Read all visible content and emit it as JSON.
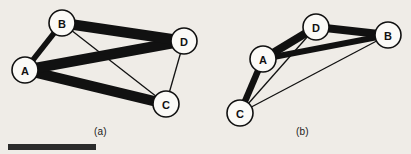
{
  "figure": {
    "background_color": "#efece7",
    "width": 411,
    "height": 154,
    "ink_color": "#111111",
    "node_fill_color": "#fbfaf7",
    "scale_bar": {
      "name": "scale-bar",
      "color": "#2b2b2b",
      "x": 8,
      "y": 144,
      "width": 88,
      "height": 6
    }
  },
  "panels": [
    {
      "id": "a",
      "caption": "(a)",
      "nodes": [
        {
          "label": "A",
          "x": 25,
          "y": 70,
          "r": 13
        },
        {
          "label": "B",
          "x": 62,
          "y": 23,
          "r": 13
        },
        {
          "label": "C",
          "x": 166,
          "y": 104,
          "r": 13
        },
        {
          "label": "D",
          "x": 184,
          "y": 41,
          "r": 13
        }
      ],
      "edges": [
        {
          "from": "A",
          "to": "B",
          "width": 5.5,
          "weight": "medium"
        },
        {
          "from": "A",
          "to": "C",
          "width": 10.5,
          "weight": "thick"
        },
        {
          "from": "A",
          "to": "D",
          "width": 10.5,
          "weight": "thick"
        },
        {
          "from": "B",
          "to": "D",
          "width": 10.5,
          "weight": "thick"
        },
        {
          "from": "B",
          "to": "C",
          "width": 1.3,
          "weight": "thin"
        },
        {
          "from": "C",
          "to": "D",
          "width": 1.3,
          "weight": "thin"
        }
      ]
    },
    {
      "id": "b",
      "caption": "(b)",
      "nodes": [
        {
          "label": "A",
          "x": 263,
          "y": 59,
          "r": 13
        },
        {
          "label": "B",
          "x": 388,
          "y": 35,
          "r": 13
        },
        {
          "label": "C",
          "x": 240,
          "y": 113,
          "r": 13
        },
        {
          "label": "D",
          "x": 316,
          "y": 27,
          "r": 13
        }
      ],
      "edges": [
        {
          "from": "A",
          "to": "D",
          "width": 8.0,
          "weight": "thick"
        },
        {
          "from": "D",
          "to": "B",
          "width": 8.0,
          "weight": "thick"
        },
        {
          "from": "A",
          "to": "B",
          "width": 6.0,
          "weight": "thick"
        },
        {
          "from": "A",
          "to": "C",
          "width": 6.5,
          "weight": "thick"
        },
        {
          "from": "A",
          "to": "D",
          "width": 1.3,
          "weight": "thin",
          "variant": "secondary"
        },
        {
          "from": "C",
          "to": "D",
          "width": 1.3,
          "weight": "thin"
        },
        {
          "from": "C",
          "to": "B",
          "width": 1.3,
          "weight": "thin"
        }
      ]
    }
  ]
}
